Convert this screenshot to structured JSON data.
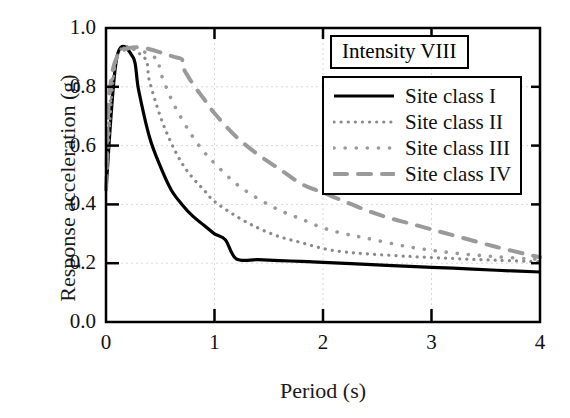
{
  "chart_data": {
    "type": "line",
    "title": "",
    "annotation": "Intensity VIII",
    "xlabel": "Period (s)",
    "ylabel": "Response acceleration (g)",
    "xlim": [
      0,
      4
    ],
    "ylim": [
      0.0,
      1.0
    ],
    "xticks": [
      0,
      1,
      2,
      3,
      4
    ],
    "xtick_labels": [
      "0",
      "1",
      "2",
      "3",
      "4"
    ],
    "yticks": [
      0.0,
      0.2,
      0.4,
      0.6,
      0.8,
      1.0
    ],
    "ytick_labels": [
      "0.0",
      "0.2",
      "0.4",
      "0.6",
      "0.8",
      "1.0"
    ],
    "grid": true,
    "grid_color": "#d8d8d8",
    "legend_position": "upper right",
    "peak_value": 0.9,
    "initial_value": 0.45,
    "series": [
      {
        "name": "Site class I",
        "style": "solid",
        "color": "#000000",
        "width": 3.2,
        "plateau_end": 0.25,
        "x": [
          0,
          0.1,
          0.25,
          0.3,
          0.4,
          0.5,
          0.6,
          0.7,
          0.8,
          0.9,
          1.0,
          1.1,
          1.2,
          1.4,
          1.6,
          1.8,
          2.0,
          2.4,
          2.8,
          3.2,
          3.6,
          4.0
        ],
        "y": [
          0.45,
          0.9,
          0.9,
          0.79,
          0.63,
          0.53,
          0.45,
          0.4,
          0.36,
          0.33,
          0.3,
          0.28,
          0.215,
          0.212,
          0.209,
          0.206,
          0.203,
          0.196,
          0.189,
          0.183,
          0.176,
          0.17
        ]
      },
      {
        "name": "Site class II",
        "style": "dotted-fine",
        "color": "#8a8a8a",
        "width": 3.2,
        "plateau_end": 0.35,
        "x": [
          0,
          0.1,
          0.35,
          0.4,
          0.5,
          0.6,
          0.7,
          0.8,
          0.9,
          1.0,
          1.2,
          1.4,
          1.6,
          1.8,
          2.0,
          2.2,
          2.4,
          2.8,
          3.2,
          3.6,
          4.0
        ],
        "y": [
          0.45,
          0.9,
          0.9,
          0.82,
          0.7,
          0.61,
          0.54,
          0.49,
          0.45,
          0.41,
          0.36,
          0.32,
          0.29,
          0.27,
          0.25,
          0.238,
          0.232,
          0.223,
          0.216,
          0.21,
          0.205
        ]
      },
      {
        "name": "Site class III",
        "style": "dotted-medium",
        "color": "#9a9a9a",
        "width": 3.6,
        "plateau_end": 0.45,
        "x": [
          0,
          0.1,
          0.45,
          0.5,
          0.6,
          0.7,
          0.8,
          0.9,
          1.0,
          1.2,
          1.4,
          1.6,
          1.8,
          2.0,
          2.2,
          2.4,
          2.8,
          3.2,
          3.6,
          4.0
        ],
        "y": [
          0.45,
          0.9,
          0.9,
          0.85,
          0.76,
          0.69,
          0.63,
          0.58,
          0.54,
          0.47,
          0.42,
          0.38,
          0.35,
          0.32,
          0.3,
          0.285,
          0.255,
          0.235,
          0.222,
          0.213
        ]
      },
      {
        "name": "Site class IV",
        "style": "dashed",
        "color": "#9a9a9a",
        "width": 4.0,
        "plateau_end": 0.65,
        "x": [
          0,
          0.1,
          0.65,
          0.7,
          0.8,
          0.9,
          1.0,
          1.2,
          1.4,
          1.6,
          1.8,
          2.0,
          2.2,
          2.4,
          2.6,
          2.8,
          3.0,
          3.2,
          3.6,
          4.0
        ],
        "y": [
          0.45,
          0.9,
          0.9,
          0.87,
          0.81,
          0.76,
          0.71,
          0.63,
          0.57,
          0.52,
          0.47,
          0.44,
          0.41,
          0.38,
          0.355,
          0.335,
          0.315,
          0.295,
          0.255,
          0.22
        ]
      }
    ]
  },
  "legend": {
    "items": [
      {
        "label": "Site class I"
      },
      {
        "label": "Site class II"
      },
      {
        "label": "Site class III"
      },
      {
        "label": "Site class IV"
      }
    ]
  },
  "annotation_box": {
    "text": "Intensity VIII"
  },
  "axes": {
    "x_title": "Period (s)",
    "y_title": "Response acceleration (g)"
  }
}
